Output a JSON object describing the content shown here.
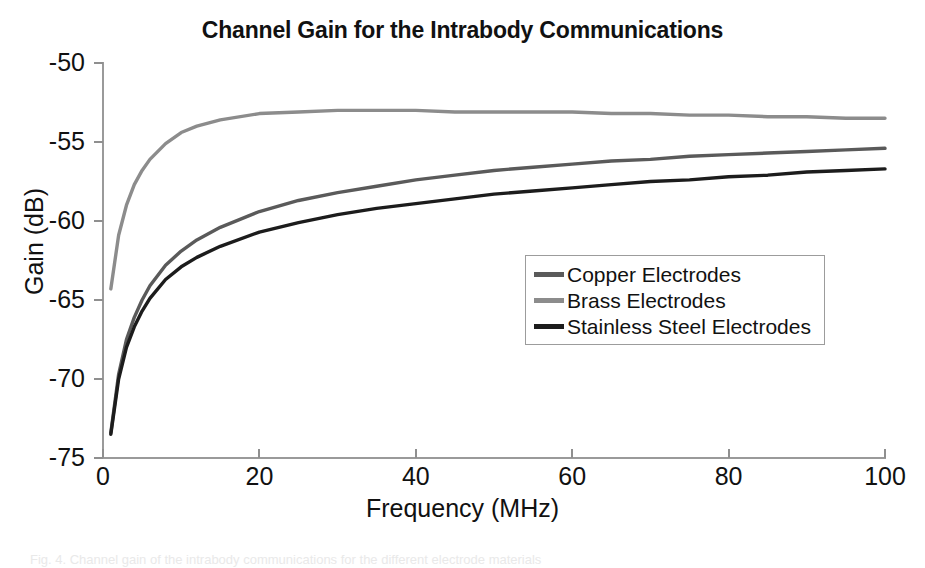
{
  "chart_data": {
    "type": "line",
    "title": "Channel Gain for the Intrabody Communications",
    "xlabel": "Frequency (MHz)",
    "ylabel": "Gain (dB)",
    "xlim": [
      0,
      100
    ],
    "ylim": [
      -75,
      -50
    ],
    "xticks": [
      0,
      20,
      40,
      60,
      80,
      100
    ],
    "yticks": [
      -75,
      -70,
      -65,
      -60,
      -55,
      -50
    ],
    "xtick_labels": [
      "0",
      "20",
      "40",
      "60",
      "80",
      "100"
    ],
    "ytick_labels": [
      "-75",
      "-70",
      "-65",
      "-60",
      "-55",
      "-50"
    ],
    "grid": false,
    "legend_position": "center-right",
    "x": [
      1,
      2,
      3,
      4,
      5,
      6,
      8,
      10,
      12,
      15,
      20,
      25,
      30,
      35,
      40,
      45,
      50,
      55,
      60,
      65,
      70,
      75,
      80,
      85,
      90,
      95,
      100
    ],
    "series": [
      {
        "name": "Copper Electrodes",
        "color": "#5a5a5a",
        "values": [
          -73.4,
          -69.7,
          -67.5,
          -66.1,
          -65.0,
          -64.1,
          -62.8,
          -61.9,
          -61.2,
          -60.4,
          -59.4,
          -58.7,
          -58.2,
          -57.8,
          -57.4,
          -57.1,
          -56.8,
          -56.6,
          -56.4,
          -56.2,
          -56.1,
          -55.9,
          -55.8,
          -55.7,
          -55.6,
          -55.5,
          -55.4
        ]
      },
      {
        "name": "Brass Electrodes",
        "color": "#8c8c8c",
        "values": [
          -64.3,
          -60.9,
          -59.0,
          -57.7,
          -56.8,
          -56.1,
          -55.1,
          -54.4,
          -54.0,
          -53.6,
          -53.2,
          -53.1,
          -53.0,
          -53.0,
          -53.0,
          -53.1,
          -53.1,
          -53.1,
          -53.1,
          -53.2,
          -53.2,
          -53.3,
          -53.3,
          -53.4,
          -53.4,
          -53.5,
          -53.5
        ]
      },
      {
        "name": "Stainless Steel Electrodes",
        "color": "#1c1c1c",
        "values": [
          -73.5,
          -70.0,
          -68.0,
          -66.7,
          -65.7,
          -64.9,
          -63.7,
          -62.9,
          -62.3,
          -61.6,
          -60.7,
          -60.1,
          -59.6,
          -59.2,
          -58.9,
          -58.6,
          -58.3,
          -58.1,
          -57.9,
          -57.7,
          -57.5,
          -57.4,
          -57.2,
          -57.1,
          -56.9,
          -56.8,
          -56.7
        ]
      }
    ]
  },
  "legend": {
    "items": [
      {
        "label": "Copper Electrodes",
        "color": "#5a5a5a"
      },
      {
        "label": "Brass Electrodes",
        "color": "#8c8c8c"
      },
      {
        "label": "Stainless Steel Electrodes",
        "color": "#1c1c1c"
      }
    ]
  },
  "caption": {
    "text": "Fig. 4. Channel gain of the intrabody communications for the different electrode materials"
  }
}
